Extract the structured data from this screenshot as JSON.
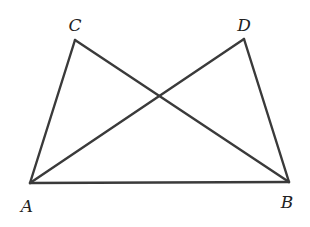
{
  "diagram": {
    "points": {
      "A": {
        "label": "A",
        "x": 30,
        "y": 183,
        "lx": 27,
        "ly": 212
      },
      "B": {
        "label": "B",
        "x": 289,
        "y": 182,
        "lx": 287,
        "ly": 208
      },
      "C": {
        "label": "C",
        "x": 75,
        "y": 40,
        "lx": 75,
        "ly": 31
      },
      "D": {
        "label": "D",
        "x": 244,
        "y": 39,
        "lx": 244,
        "ly": 31
      }
    },
    "segments": [
      [
        "A",
        "B"
      ],
      [
        "A",
        "C"
      ],
      [
        "C",
        "B"
      ],
      [
        "A",
        "D"
      ],
      [
        "D",
        "B"
      ]
    ],
    "colors": {
      "stroke": "#3a3a3a",
      "background": "#ffffff"
    }
  }
}
